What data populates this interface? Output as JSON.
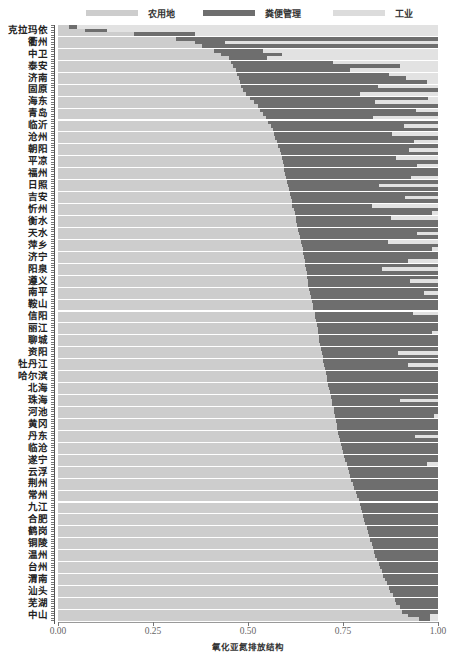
{
  "colors": {
    "agri": "#cdcdcd",
    "manure": "#6e6e6e",
    "industry": "#e2e2e2"
  },
  "legend": [
    {
      "label": "农用地",
      "color": "#cdcdcd",
      "left": 86
    },
    {
      "label": "粪便管理",
      "color": "#6e6e6e",
      "left": 203
    },
    {
      "label": "工业",
      "color": "#dcdcdc",
      "left": 333
    }
  ],
  "chart_data": {
    "type": "bar",
    "orientation": "horizontal",
    "stacked": "100%",
    "title": "",
    "xlabel": "氧化亚氮排放结构",
    "ylabel": "",
    "xlim": [
      0,
      1
    ],
    "xticks": [
      "0.00",
      "0.25",
      "0.50",
      "0.75",
      "1.00"
    ],
    "legend_position": "top",
    "grid": false,
    "categories": [
      "克拉玛依",
      "衢州",
      "中卫",
      "泰安",
      "济南",
      "固原",
      "海东",
      "青岛",
      "临沂",
      "沧州",
      "朝阳",
      "平凉",
      "福州",
      "日照",
      "吉安",
      "忻州",
      "衡水",
      "天水",
      "萍乡",
      "济宁",
      "阳泉",
      "遵义",
      "南平",
      "鞍山",
      "信阳",
      "丽江",
      "聊城",
      "资阳",
      "牡丹江",
      "哈尔滨",
      "北海",
      "珠海",
      "河池",
      "黄冈",
      "丹东",
      "临沧",
      "遂宁",
      "云浮",
      "荆州",
      "常州",
      "九江",
      "合肥",
      "鹤岗",
      "铜陵",
      "温州",
      "台州",
      "渭南",
      "汕头",
      "芜湖",
      "中山"
    ],
    "series": [
      {
        "name": "农用地",
        "values": [
          0.07,
          0.36,
          0.43,
          0.46,
          0.475,
          0.487,
          0.515,
          0.54,
          0.56,
          0.572,
          0.584,
          0.592,
          0.597,
          0.605,
          0.612,
          0.62,
          0.627,
          0.634,
          0.641,
          0.648,
          0.652,
          0.657,
          0.663,
          0.67,
          0.677,
          0.683,
          0.688,
          0.695,
          0.7,
          0.707,
          0.713,
          0.72,
          0.727,
          0.733,
          0.74,
          0.748,
          0.756,
          0.765,
          0.775,
          0.787,
          0.797,
          0.806,
          0.815,
          0.825,
          0.835,
          0.848,
          0.86,
          0.874,
          0.89,
          0.92
        ]
      },
      {
        "name": "粪便管理",
        "values": [
          0.06,
          0.08,
          0.16,
          0.44,
          0.44,
          0.513,
          0.32,
          0.46,
          0.35,
          0.428,
          0.34,
          0.408,
          0.403,
          0.24,
          0.3,
          0.38,
          0.373,
          0.31,
          0.359,
          0.352,
          0.2,
          0.27,
          0.3,
          0.33,
          0.323,
          0.317,
          0.312,
          0.2,
          0.22,
          0.293,
          0.287,
          0.18,
          0.273,
          0.267,
          0.2,
          0.252,
          0.244,
          0.235,
          0.225,
          0.213,
          0.203,
          0.194,
          0.185,
          0.175,
          0.165,
          0.152,
          0.14,
          0.126,
          0.11,
          0.06
        ]
      },
      {
        "name": "工业",
        "values": [
          0.87,
          0.56,
          0.41,
          0.1,
          0.085,
          0.0,
          0.165,
          0.0,
          0.09,
          0.0,
          0.076,
          0.0,
          0.0,
          0.155,
          0.088,
          0.0,
          0.0,
          0.056,
          0.0,
          0.0,
          0.148,
          0.073,
          0.037,
          0.0,
          0.0,
          0.0,
          0.0,
          0.105,
          0.08,
          0.0,
          0.0,
          0.1,
          0.0,
          0.0,
          0.06,
          0.0,
          0.0,
          0.0,
          0.0,
          0.0,
          0.0,
          0.0,
          0.0,
          0.0,
          0.0,
          0.0,
          0.0,
          0.0,
          0.0,
          0.02
        ]
      }
    ],
    "sub_rows": [
      [
        [
          0.03,
          0.02,
          0.95
        ],
        [
          0.07,
          0.06,
          0.87
        ],
        [
          0.2,
          0.16,
          0.64
        ]
      ],
      [
        [
          0.31,
          0.69,
          0.0
        ],
        [
          0.36,
          0.08,
          0.56
        ],
        [
          0.38,
          0.62,
          0.0
        ]
      ],
      [
        [
          0.41,
          0.13,
          0.46
        ],
        [
          0.43,
          0.16,
          0.41
        ],
        [
          0.45,
          0.1,
          0.45
        ]
      ],
      [
        [
          0.455,
          0.27,
          0.275
        ],
        [
          0.46,
          0.44,
          0.1
        ],
        [
          0.468,
          0.3,
          0.232
        ]
      ],
      [
        [
          0.47,
          0.4,
          0.13
        ],
        [
          0.475,
          0.44,
          0.085
        ],
        [
          0.48,
          0.49,
          0.03
        ]
      ],
      [
        [
          0.482,
          0.36,
          0.158
        ],
        [
          0.487,
          0.513,
          0.0
        ],
        [
          0.495,
          0.3,
          0.205
        ]
      ],
      [
        [
          0.505,
          0.47,
          0.025
        ],
        [
          0.515,
          0.32,
          0.165
        ],
        [
          0.525,
          0.475,
          0.0
        ]
      ],
      [
        [
          0.532,
          0.41,
          0.058
        ],
        [
          0.54,
          0.46,
          0.0
        ],
        [
          0.548,
          0.28,
          0.172
        ]
      ],
      [
        [
          0.553,
          0.447,
          0.0
        ],
        [
          0.56,
          0.35,
          0.09
        ],
        [
          0.565,
          0.435,
          0.0
        ]
      ],
      [
        [
          0.568,
          0.31,
          0.122
        ],
        [
          0.572,
          0.428,
          0.0
        ],
        [
          0.577,
          0.36,
          0.063
        ]
      ],
      [
        [
          0.58,
          0.42,
          0.0
        ],
        [
          0.584,
          0.34,
          0.076
        ],
        [
          0.588,
          0.412,
          0.0
        ]
      ],
      [
        [
          0.59,
          0.3,
          0.11
        ],
        [
          0.592,
          0.408,
          0.0
        ],
        [
          0.595,
          0.35,
          0.055
        ]
      ],
      [
        [
          0.596,
          0.404,
          0.0
        ],
        [
          0.597,
          0.403,
          0.0
        ],
        [
          0.6,
          0.33,
          0.07
        ]
      ],
      [
        [
          0.602,
          0.398,
          0.0
        ],
        [
          0.605,
          0.24,
          0.155
        ],
        [
          0.608,
          0.392,
          0.0
        ]
      ],
      [
        [
          0.61,
          0.39,
          0.0
        ],
        [
          0.612,
          0.3,
          0.088
        ],
        [
          0.615,
          0.385,
          0.0
        ]
      ],
      [
        [
          0.617,
          0.21,
          0.173
        ],
        [
          0.62,
          0.38,
          0.0
        ],
        [
          0.623,
          0.36,
          0.017
        ]
      ],
      [
        [
          0.625,
          0.25,
          0.125
        ],
        [
          0.627,
          0.373,
          0.0
        ],
        [
          0.63,
          0.37,
          0.0
        ]
      ],
      [
        [
          0.632,
          0.368,
          0.0
        ],
        [
          0.634,
          0.31,
          0.056
        ],
        [
          0.637,
          0.363,
          0.0
        ]
      ],
      [
        [
          0.639,
          0.23,
          0.131
        ],
        [
          0.641,
          0.359,
          0.0
        ],
        [
          0.644,
          0.34,
          0.016
        ]
      ],
      [
        [
          0.646,
          0.354,
          0.0
        ],
        [
          0.648,
          0.352,
          0.0
        ],
        [
          0.65,
          0.27,
          0.08
        ]
      ],
      [
        [
          0.651,
          0.349,
          0.0
        ],
        [
          0.652,
          0.2,
          0.148
        ],
        [
          0.654,
          0.346,
          0.0
        ]
      ],
      [
        [
          0.655,
          0.345,
          0.0
        ],
        [
          0.657,
          0.27,
          0.073
        ],
        [
          0.659,
          0.341,
          0.0
        ]
      ],
      [
        [
          0.661,
          0.339,
          0.0
        ],
        [
          0.663,
          0.3,
          0.037
        ],
        [
          0.665,
          0.335,
          0.0
        ]
      ],
      [
        [
          0.668,
          0.332,
          0.0
        ],
        [
          0.67,
          0.33,
          0.0
        ],
        [
          0.672,
          0.328,
          0.0
        ]
      ],
      [
        [
          0.675,
          0.26,
          0.065
        ],
        [
          0.677,
          0.323,
          0.0
        ],
        [
          0.679,
          0.321,
          0.0
        ]
      ],
      [
        [
          0.681,
          0.319,
          0.0
        ],
        [
          0.683,
          0.317,
          0.0
        ],
        [
          0.685,
          0.3,
          0.015
        ]
      ],
      [
        [
          0.686,
          0.314,
          0.0
        ],
        [
          0.688,
          0.312,
          0.0
        ],
        [
          0.69,
          0.31,
          0.0
        ]
      ],
      [
        [
          0.693,
          0.307,
          0.0
        ],
        [
          0.695,
          0.2,
          0.105
        ],
        [
          0.697,
          0.303,
          0.0
        ]
      ],
      [
        [
          0.698,
          0.302,
          0.0
        ],
        [
          0.7,
          0.22,
          0.08
        ],
        [
          0.702,
          0.298,
          0.0
        ]
      ],
      [
        [
          0.705,
          0.295,
          0.0
        ],
        [
          0.707,
          0.293,
          0.0
        ],
        [
          0.709,
          0.291,
          0.0
        ]
      ],
      [
        [
          0.711,
          0.289,
          0.0
        ],
        [
          0.713,
          0.287,
          0.0
        ],
        [
          0.715,
          0.285,
          0.0
        ]
      ],
      [
        [
          0.718,
          0.282,
          0.0
        ],
        [
          0.72,
          0.18,
          0.1
        ],
        [
          0.722,
          0.278,
          0.0
        ]
      ],
      [
        [
          0.725,
          0.275,
          0.0
        ],
        [
          0.727,
          0.273,
          0.0
        ],
        [
          0.729,
          0.26,
          0.011
        ]
      ],
      [
        [
          0.731,
          0.269,
          0.0
        ],
        [
          0.733,
          0.267,
          0.0
        ],
        [
          0.735,
          0.265,
          0.0
        ]
      ],
      [
        [
          0.738,
          0.262,
          0.0
        ],
        [
          0.74,
          0.2,
          0.06
        ],
        [
          0.742,
          0.258,
          0.0
        ]
      ],
      [
        [
          0.745,
          0.255,
          0.0
        ],
        [
          0.748,
          0.252,
          0.0
        ],
        [
          0.751,
          0.249,
          0.0
        ]
      ],
      [
        [
          0.753,
          0.247,
          0.0
        ],
        [
          0.756,
          0.244,
          0.0
        ],
        [
          0.76,
          0.21,
          0.03
        ]
      ],
      [
        [
          0.762,
          0.238,
          0.0
        ],
        [
          0.765,
          0.235,
          0.0
        ],
        [
          0.769,
          0.231,
          0.0
        ]
      ],
      [
        [
          0.771,
          0.229,
          0.0
        ],
        [
          0.775,
          0.225,
          0.0
        ],
        [
          0.779,
          0.221,
          0.0
        ]
      ],
      [
        [
          0.783,
          0.217,
          0.0
        ],
        [
          0.787,
          0.213,
          0.0
        ],
        [
          0.791,
          0.209,
          0.0
        ]
      ],
      [
        [
          0.794,
          0.206,
          0.0
        ],
        [
          0.797,
          0.203,
          0.0
        ],
        [
          0.8,
          0.2,
          0.0
        ]
      ],
      [
        [
          0.803,
          0.197,
          0.0
        ],
        [
          0.806,
          0.194,
          0.0
        ],
        [
          0.809,
          0.191,
          0.0
        ]
      ],
      [
        [
          0.812,
          0.188,
          0.0
        ],
        [
          0.815,
          0.185,
          0.0
        ],
        [
          0.819,
          0.181,
          0.0
        ]
      ],
      [
        [
          0.822,
          0.178,
          0.0
        ],
        [
          0.825,
          0.175,
          0.0
        ],
        [
          0.829,
          0.171,
          0.0
        ]
      ],
      [
        [
          0.832,
          0.168,
          0.0
        ],
        [
          0.835,
          0.165,
          0.0
        ],
        [
          0.84,
          0.16,
          0.0
        ]
      ],
      [
        [
          0.844,
          0.156,
          0.0
        ],
        [
          0.848,
          0.152,
          0.0
        ],
        [
          0.853,
          0.147,
          0.0
        ]
      ],
      [
        [
          0.856,
          0.144,
          0.0
        ],
        [
          0.86,
          0.14,
          0.0
        ],
        [
          0.866,
          0.134,
          0.0
        ]
      ],
      [
        [
          0.87,
          0.13,
          0.0
        ],
        [
          0.874,
          0.126,
          0.0
        ],
        [
          0.881,
          0.119,
          0.0
        ]
      ],
      [
        [
          0.886,
          0.114,
          0.0
        ],
        [
          0.89,
          0.11,
          0.0
        ],
        [
          0.9,
          0.1,
          0.0
        ]
      ],
      [
        [
          0.905,
          0.095,
          0.0
        ],
        [
          0.92,
          0.06,
          0.02
        ],
        [
          0.95,
          0.03,
          0.02
        ]
      ]
    ]
  }
}
